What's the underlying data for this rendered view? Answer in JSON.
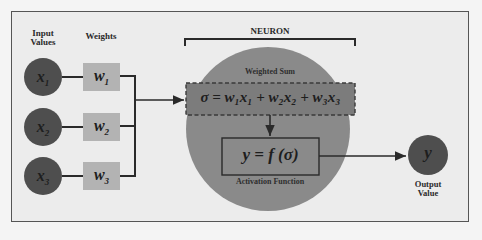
{
  "diagram": {
    "title": "NEURON",
    "column_labels": {
      "inputs": "Input Values",
      "weights": "Weights"
    },
    "inputs": [
      {
        "label": "x",
        "sub": "1"
      },
      {
        "label": "x",
        "sub": "2"
      },
      {
        "label": "x",
        "sub": "3"
      }
    ],
    "weights": [
      {
        "label": "w",
        "sub": "1"
      },
      {
        "label": "w",
        "sub": "2"
      },
      {
        "label": "w",
        "sub": "3"
      }
    ],
    "weighted_sum": {
      "caption": "Weighted Sum",
      "formula": "σ = w₁x₁ + w₂x₂ + w₃x₃"
    },
    "activation": {
      "caption": "Activation Function",
      "formula": "y = f (σ)"
    },
    "output": {
      "symbol": "y",
      "caption": "Output Value"
    },
    "colors": {
      "input_circle": "#4e4e4e",
      "weight_box": "#b3b3b3",
      "neuron_circle": "#8a8a8a",
      "output_circle": "#4e4e4e",
      "line": "#2a2a2a",
      "background": "#ececec"
    }
  }
}
